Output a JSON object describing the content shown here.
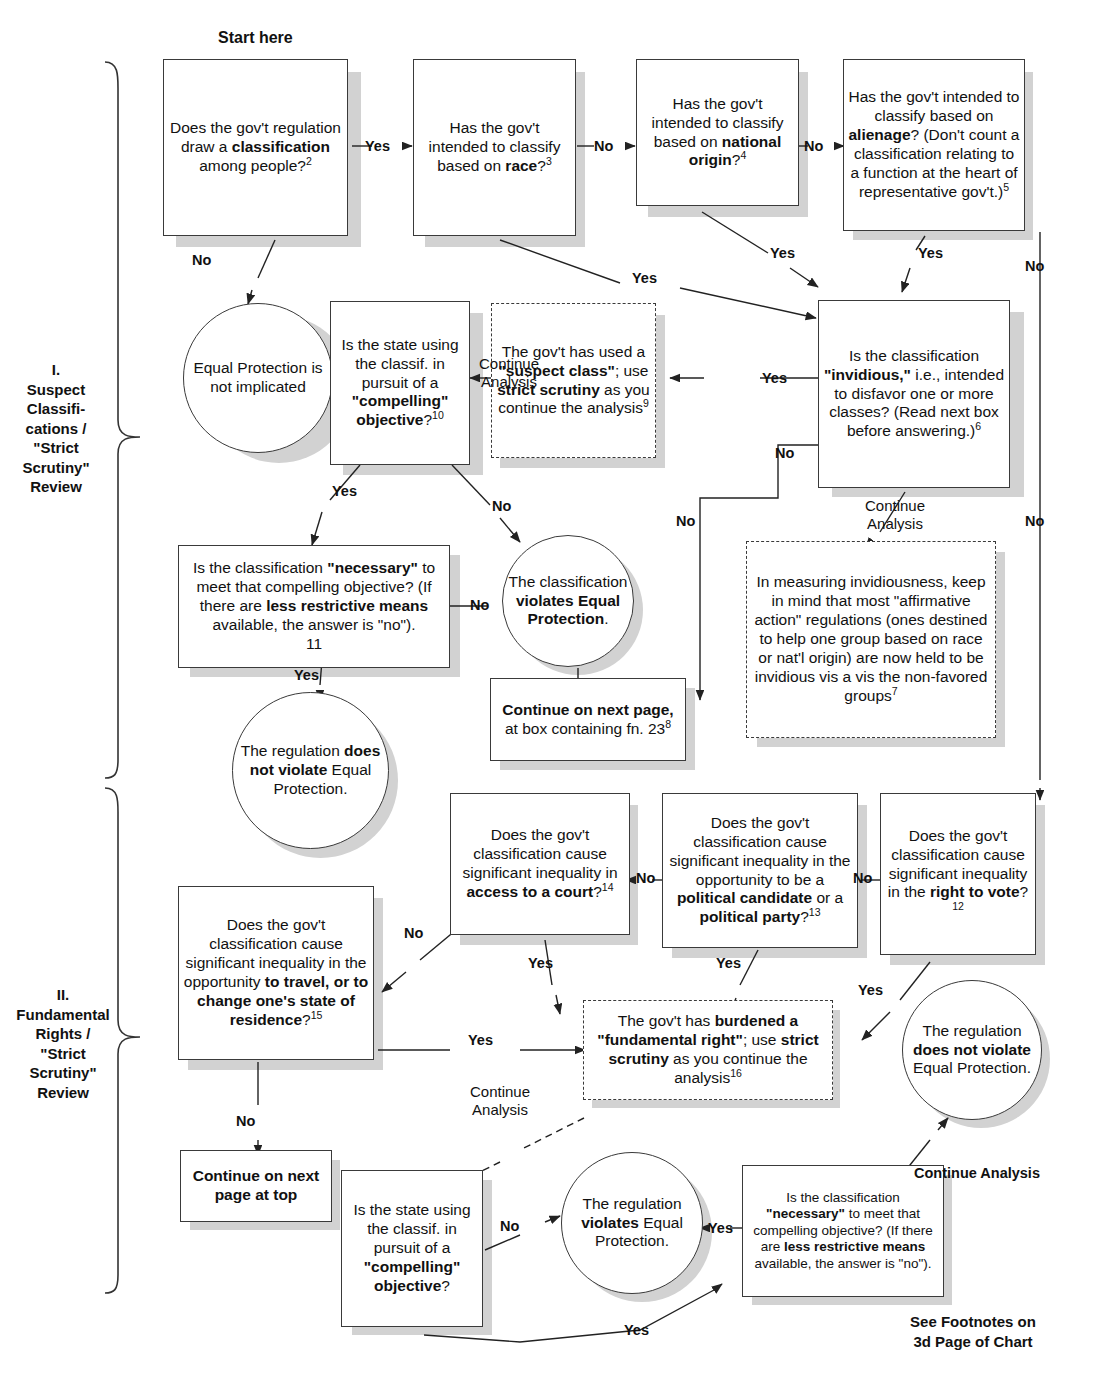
{
  "meta": {
    "start_label": "Start here",
    "footer_note_line1": "See Footnotes on",
    "footer_note_line2": "3d Page of Chart"
  },
  "sections": [
    {
      "id": "section-1",
      "label": "I.\nSuspect\nClassifi-\ncations /\n\"Strict\nScrutiny\"\nReview"
    },
    {
      "id": "section-2",
      "label": "II.\nFundamental\nRights /\n\"Strict\nScrutiny\"\nReview"
    }
  ],
  "nodes": {
    "n1_classification": {
      "html": "Does the gov't regulation draw a <b>classification</b> among people?<sup>2</sup>",
      "shape": "box"
    },
    "n2_race": {
      "html": "Has the gov't intended to classify based on <b>race</b>?<sup>3</sup>",
      "shape": "box"
    },
    "n3_national_origin": {
      "html": "Has the gov't intended to classify based on <b>national origin</b>?<sup>4</sup>",
      "shape": "box"
    },
    "n4_alienage": {
      "html": "Has the gov't intended to classify based on <b>alienage</b>? (Don't count a classification relating to a function at the heart of representative gov't.)<sup>5</sup>",
      "shape": "box"
    },
    "n5_not_implicated": {
      "html": "Equal Protection is not implicated",
      "shape": "circle"
    },
    "n6_compelling": {
      "html": "Is the state using the classif. in pursuit of a <b>\"compelling\" objective</b>?<sup>10</sup>",
      "shape": "box"
    },
    "n7_suspect_class": {
      "html": "The gov't has used a <b>\"suspect class\"</b>; use <b>strict scrutiny</b> as you continue the analysis<sup>9</sup>",
      "shape": "box-dashed"
    },
    "n8_invidious": {
      "html": "Is the classification <b>\"invidious,\"</b> i.e., intended to disfavor one or more classes? (Read next box before answering.)<sup>6</sup>",
      "shape": "box"
    },
    "n9_necessary": {
      "html": "Is the classification <b>\"necessary\"</b> to meet that compelling objective? (If there are <b>less restrictive means</b> available, the answer is \"no\").<br>11",
      "shape": "box"
    },
    "n10_violates": {
      "html": "The classification <b>violates Equal Protection</b>.",
      "shape": "circle"
    },
    "n11_affirmative_action": {
      "html": "In measuring invidiousness, keep in mind that most \"affirmative action\" regulations (ones destined to help one group based on race or nat'l origin) are now held to be invidious vis a vis the non-favored groups<sup>7</sup>",
      "shape": "box-dashed"
    },
    "n12_continue_next_page": {
      "html": "<b>Continue on next page,</b> at box containing fn. 23<sup>8</sup>",
      "shape": "box"
    },
    "n13_no_violation_top": {
      "html": "The regulation <b>does not violate</b> Equal Protection.",
      "shape": "circle"
    },
    "n14_access_court": {
      "html": "Does the gov't classification cause significant inequality in <b>access to a court</b>?<sup>14</sup>",
      "shape": "box"
    },
    "n15_political": {
      "html": "Does the gov't classification cause significant inequality in the opportunity to be a <b>political candidate</b> or a <b>political party</b>?<sup>13</sup>",
      "shape": "box"
    },
    "n16_right_to_vote": {
      "html": "Does the gov't classification cause significant inequality in the <b>right to vote</b>?<sup>12</sup>",
      "shape": "box"
    },
    "n17_travel": {
      "html": "Does the gov't classification cause significant inequality in the opportunity <b>to travel, or  to change one's state of residence</b>?<sup>15</sup>",
      "shape": "box"
    },
    "n18_fundamental_right": {
      "html": "The gov't has <b>burdened a \"fundamental right\"</b>;  use <b>strict scrutiny</b> as you continue the analysis<sup>16</sup>",
      "shape": "box-dashed"
    },
    "n19_no_violation_bottom": {
      "html": "The regulation <b>does not violate</b> Equal Protection.",
      "shape": "circle"
    },
    "n20_continue_next_page_top": {
      "html": "<b>Continue on next page at top</b>",
      "shape": "box"
    },
    "n21_compelling2": {
      "html": "Is the state using the classif. in pursuit of a <b>\"compelling\" objective</b>?",
      "shape": "box"
    },
    "n22_violates2": {
      "html": "The regulation <b>violates</b> Equal Protection.",
      "shape": "circle"
    },
    "n23_necessary2": {
      "html": "Is the classification <b>\"necessary\"</b> to meet that compelling objective? (If there are <b>less restrictive means</b> available, the answer is \"no\").",
      "shape": "box"
    }
  },
  "edge_labels": {
    "e1": "Yes",
    "e2": "No",
    "e3": "No",
    "e4": "No",
    "e5": "No",
    "e6": "Yes",
    "e7": "Yes",
    "e8": "Yes",
    "e9": "Yes",
    "e10": "Continue Analysis",
    "e11": "Yes",
    "e12": "No",
    "e13": "No",
    "e14": "No",
    "e15": "No",
    "e16": "Continue Analysis",
    "e17": "Yes",
    "e18": "No",
    "e19": "No",
    "e20": "No",
    "e21": "Yes",
    "e22": "Yes",
    "e23": "Yes",
    "e24": "Yes",
    "e25": "No",
    "e26": "Continue Analysis",
    "e27": "No",
    "e28": "No",
    "e29": "Yes",
    "e30": "Yes"
  },
  "chart_data": {
    "type": "flowchart",
    "sections": [
      "I. Suspect Classifications / \"Strict Scrutiny\" Review",
      "II. Fundamental Rights / \"Strict Scrutiny\" Review"
    ],
    "edges": [
      {
        "from": "n1_classification",
        "to": "n2_race",
        "label": "Yes"
      },
      {
        "from": "n1_classification",
        "to": "n5_not_implicated",
        "label": "No"
      },
      {
        "from": "n2_race",
        "to": "n3_national_origin",
        "label": "No"
      },
      {
        "from": "n2_race",
        "to": "n8_invidious",
        "label": "Yes"
      },
      {
        "from": "n3_national_origin",
        "to": "n4_alienage",
        "label": "No"
      },
      {
        "from": "n3_national_origin",
        "to": "n8_invidious",
        "label": "Yes"
      },
      {
        "from": "n4_alienage",
        "to": "n8_invidious",
        "label": "Yes"
      },
      {
        "from": "n4_alienage",
        "to": "n16_right_to_vote",
        "label": "No"
      },
      {
        "from": "n8_invidious",
        "to": "n7_suspect_class",
        "label": "Yes"
      },
      {
        "from": "n8_invidious",
        "to": "n12_continue_next_page",
        "label": "No"
      },
      {
        "from": "n8_invidious",
        "to": "n11_affirmative_action",
        "label": "Continue Analysis"
      },
      {
        "from": "n7_suspect_class",
        "to": "n6_compelling",
        "label": "Continue Analysis"
      },
      {
        "from": "n6_compelling",
        "to": "n9_necessary",
        "label": "Yes"
      },
      {
        "from": "n6_compelling",
        "to": "n10_violates",
        "label": "No"
      },
      {
        "from": "n9_necessary",
        "to": "n10_violates",
        "label": "No"
      },
      {
        "from": "n9_necessary",
        "to": "n13_no_violation_top",
        "label": "Yes"
      },
      {
        "from": "n16_right_to_vote",
        "to": "n15_political",
        "label": "No"
      },
      {
        "from": "n16_right_to_vote",
        "to": "n18_fundamental_right",
        "label": "Yes"
      },
      {
        "from": "n15_political",
        "to": "n14_access_court",
        "label": "No"
      },
      {
        "from": "n15_political",
        "to": "n18_fundamental_right",
        "label": "Yes"
      },
      {
        "from": "n14_access_court",
        "to": "n17_travel",
        "label": "No"
      },
      {
        "from": "n14_access_court",
        "to": "n18_fundamental_right",
        "label": "Yes"
      },
      {
        "from": "n17_travel",
        "to": "n18_fundamental_right",
        "label": "Yes"
      },
      {
        "from": "n17_travel",
        "to": "n20_continue_next_page_top",
        "label": "No"
      },
      {
        "from": "n18_fundamental_right",
        "to": "n21_compelling2",
        "label": "Continue Analysis"
      },
      {
        "from": "n21_compelling2",
        "to": "n22_violates2",
        "label": "No"
      },
      {
        "from": "n21_compelling2",
        "to": "n23_necessary2",
        "label": "Yes"
      },
      {
        "from": "n23_necessary2",
        "to": "n22_violates2",
        "label": "No"
      },
      {
        "from": "n23_necessary2",
        "to": "n19_no_violation_bottom",
        "label": "Yes"
      }
    ]
  }
}
